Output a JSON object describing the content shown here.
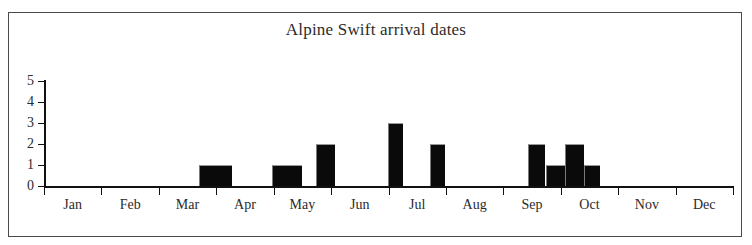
{
  "chart_data": {
    "type": "bar",
    "title": "Alpine Swift arrival dates",
    "xlabel": "",
    "ylabel": "",
    "ylim": [
      0,
      5
    ],
    "xlim": [
      "Jan",
      "Dec"
    ],
    "grid": false,
    "legend": null,
    "y_ticks": [
      "5",
      "4",
      "3",
      "2",
      "1",
      "0"
    ],
    "y_tick_values": [
      5,
      4,
      3,
      2,
      1,
      0
    ],
    "categories": [
      "Jan",
      "Feb",
      "Mar",
      "Apr",
      "May",
      "Jun",
      "Jul",
      "Aug",
      "Sep",
      "Oct",
      "Nov",
      "Dec"
    ],
    "bin_description": "counts per ten-day period across the year",
    "bins": [
      {
        "label": "Jan early",
        "month": "Jan",
        "start_frac": 0.0,
        "end_frac": 0.028,
        "value": 0
      },
      {
        "label": "Mar late",
        "month": "Mar",
        "start_frac": 0.225,
        "end_frac": 0.273,
        "value": 1
      },
      {
        "label": "May early",
        "month": "May",
        "start_frac": 0.331,
        "end_frac": 0.374,
        "value": 1
      },
      {
        "label": "May late",
        "month": "May",
        "start_frac": 0.395,
        "end_frac": 0.422,
        "value": 2
      },
      {
        "label": "Jun late",
        "month": "Jun",
        "start_frac": 0.499,
        "end_frac": 0.521,
        "value": 3
      },
      {
        "label": "Jul early",
        "month": "Jul",
        "start_frac": 0.56,
        "end_frac": 0.582,
        "value": 2
      },
      {
        "label": "Sep early",
        "month": "Sep",
        "start_frac": 0.703,
        "end_frac": 0.728,
        "value": 2
      },
      {
        "label": "Sep mid",
        "month": "Sep",
        "start_frac": 0.728,
        "end_frac": 0.756,
        "value": 1
      },
      {
        "label": "Sep late",
        "month": "Sep",
        "start_frac": 0.756,
        "end_frac": 0.784,
        "value": 2
      },
      {
        "label": "Oct early",
        "month": "Oct",
        "start_frac": 0.784,
        "end_frac": 0.807,
        "value": 1
      }
    ],
    "values_by_bin": [
      1,
      1,
      2,
      3,
      2,
      2,
      1,
      2,
      1
    ],
    "max_value": 3,
    "total_records": 16,
    "colors": {
      "bar": "#0a0a0a",
      "axis": "#111111",
      "text": "#2b2b2b",
      "frame": "#4a4a4a",
      "background": "#ffffff"
    }
  }
}
